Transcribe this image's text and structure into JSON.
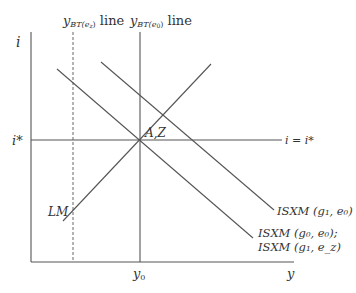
{
  "diagram": {
    "type": "economics-model",
    "axes": {
      "y_axis_label": "i",
      "x_axis_label": "y",
      "y_tick_label": "i*",
      "x_tick_label": "y",
      "x_tick_sub": "0"
    },
    "vertical_lines": {
      "ybt_ez": {
        "main": "y",
        "sub": "BT(e",
        "subsub": "z",
        "close": ")",
        "suffix": " line"
      },
      "ybt_e0": {
        "main": "y",
        "sub": "BT(e",
        "subsub": "0",
        "close": ")",
        "suffix": " line"
      }
    },
    "horizontal_line_label": "i = i*",
    "intersection_label": "A,Z",
    "curves": {
      "lm": "LM",
      "isxm_g1_e0": "ISXM (g₁, e₀)",
      "isxm_g0_e0": "ISXM (g₀, e₀);",
      "isxm_g1_ez": "ISXM (g₁, e_z)"
    },
    "colors": {
      "line": "#555555",
      "text": "#333333"
    }
  }
}
